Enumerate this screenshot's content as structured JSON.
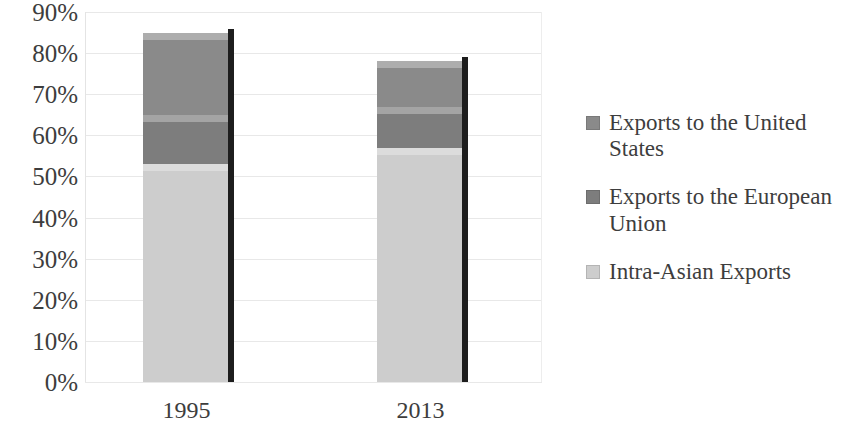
{
  "chart_data": {
    "type": "bar",
    "subtype": "stacked-column",
    "title": "",
    "subtitle": "",
    "xlabel": "",
    "ylabel": "",
    "categories": [
      "1995",
      "2013"
    ],
    "series": [
      {
        "name": "Intra-Asian Exports",
        "color": "#cdcdcd",
        "values": [
          53,
          57
        ]
      },
      {
        "name": "Exports to the European Union",
        "color": "#7d7d7d",
        "values": [
          12,
          10
        ]
      },
      {
        "name": "Exports to the United States",
        "color": "#8a8a8a",
        "values": [
          20,
          11
        ]
      }
    ],
    "stack_order_bottom_to_top": [
      "Intra-Asian Exports",
      "Exports to the European Union",
      "Exports to the United States"
    ],
    "stack_totals": [
      85,
      78
    ],
    "ylim": [
      0,
      90
    ],
    "ytick_step": 10,
    "ytick_labels": [
      "0%",
      "10%",
      "20%",
      "30%",
      "40%",
      "50%",
      "60%",
      "70%",
      "80%",
      "90%"
    ],
    "ytick_values": [
      0,
      10,
      20,
      30,
      40,
      50,
      60,
      70,
      80,
      90
    ],
    "value_suffix": "%",
    "grid": true,
    "grid_axis": "y",
    "legend_position": "right"
  },
  "legend": {
    "items": [
      {
        "label": "Exports to the United States",
        "color": "#8a8a8a",
        "swatch_name": "legend-swatch-united-states"
      },
      {
        "label": "Exports to the European Union",
        "color": "#7d7d7d",
        "swatch_name": "legend-swatch-european-union"
      },
      {
        "label": "Intra-Asian Exports",
        "color": "#cdcdcd",
        "swatch_name": "legend-swatch-intra-asian"
      }
    ]
  },
  "colors": {
    "background": "#ffffff",
    "text": "#3d3d3d",
    "gridline": "#e8e8e8",
    "bar_shadow": "#1d1d1d"
  }
}
